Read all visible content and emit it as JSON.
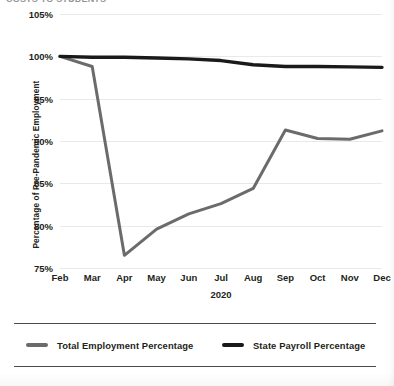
{
  "title_strip": {
    "text": "COSTS TO STUDENTS"
  },
  "chart_data": {
    "type": "line",
    "title": "",
    "xlabel": "2020",
    "ylabel": "Percentage of Pre-Pandemic Employment",
    "categories": [
      "Feb",
      "Mar",
      "Apr",
      "May",
      "Jun",
      "Jul",
      "Aug",
      "Sep",
      "Oct",
      "Nov",
      "Dec"
    ],
    "ylim": [
      75,
      105
    ],
    "yticks": [
      "75%",
      "80%",
      "85%",
      "90%",
      "95%",
      "100%",
      "105%"
    ],
    "ytick_values": [
      75,
      80,
      85,
      90,
      95,
      100,
      105
    ],
    "grid": true,
    "legend_position": "bottom",
    "series": [
      {
        "name": "Total Employment Percentage",
        "color": "#6b6b6b",
        "values": [
          100.0,
          98.8,
          76.5,
          79.6,
          81.4,
          82.6,
          84.4,
          91.3,
          90.3,
          90.2,
          91.2
        ]
      },
      {
        "name": "State Payroll Percentage",
        "color": "#1a1a1a",
        "values": [
          100.0,
          99.9,
          99.9,
          99.8,
          99.7,
          99.5,
          99.0,
          98.8,
          98.8,
          98.75,
          98.7
        ]
      }
    ]
  }
}
